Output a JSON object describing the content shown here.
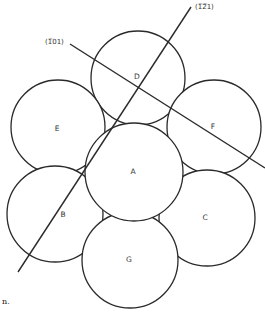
{
  "diagram": {
    "type": "atom-packing-projection",
    "planes": [
      {
        "id": "plane-121",
        "label": "(1̅2̅1)",
        "text": "(121)",
        "x1": 18,
        "y1": 272,
        "x2": 191,
        "y2": 7,
        "label_x": 195,
        "label_y": 9
      },
      {
        "id": "plane-101",
        "label": "(1̅01)",
        "text": "(101)",
        "x1": 70,
        "y1": 44,
        "x2": 265,
        "y2": 168,
        "label_x": 45,
        "label_y": 44
      }
    ],
    "circles": [
      {
        "id": "D",
        "label": "D",
        "cx": 138,
        "cy": 78,
        "r": 47,
        "label_x": 137,
        "label_y": 77
      },
      {
        "id": "E",
        "label": "E",
        "cx": 58,
        "cy": 127,
        "r": 47,
        "label_x": 57,
        "label_y": 129
      },
      {
        "id": "F",
        "label": "F",
        "cx": 214,
        "cy": 127,
        "r": 47,
        "label_x": 213,
        "label_y": 127
      },
      {
        "id": "B",
        "label": "B",
        "cx": 55,
        "cy": 214,
        "r": 48,
        "label_x": 63,
        "label_y": 215
      },
      {
        "id": "C",
        "label": "C",
        "cx": 207,
        "cy": 218,
        "r": 48,
        "label_x": 205,
        "label_y": 218
      },
      {
        "id": "G",
        "label": "G",
        "cx": 130,
        "cy": 260,
        "r": 48,
        "label_x": 129,
        "label_y": 260
      },
      {
        "id": "A",
        "label": "A",
        "cx": 134,
        "cy": 172,
        "r": 49,
        "label_x": 133,
        "label_y": 172
      }
    ],
    "caption_fragment": "n."
  }
}
